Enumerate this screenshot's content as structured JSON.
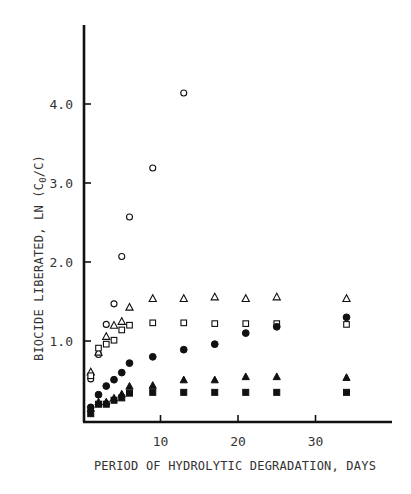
{
  "chart_data": {
    "type": "scatter",
    "title": "",
    "xlabel": "PERIOD OF HYDROLYTIC DEGRADATION, DAYS",
    "ylabel_parts": {
      "pre": "BIOCIDE LIBERATED, LN (C",
      "sub": "0",
      "post": "/C)"
    },
    "ylabel": "BIOCIDE LIBERATED, LN (C0/C)",
    "xlim": [
      0,
      39.5
    ],
    "ylim": [
      0,
      5.0
    ],
    "xticks": [
      10,
      20,
      30
    ],
    "xtick_labels": [
      "10",
      "20",
      "30"
    ],
    "yticks": [
      1.0,
      2.0,
      3.0,
      4.0
    ],
    "ytick_labels": [
      "1.0",
      "2.0",
      "3.0",
      "4.0"
    ],
    "grid": false,
    "legend": "none",
    "series": [
      {
        "name": "open-circle",
        "marker": "circle-open",
        "x": [
          1,
          2,
          3,
          4,
          5,
          6,
          9,
          13
        ],
        "y": [
          0.52,
          0.83,
          1.21,
          1.47,
          2.07,
          2.57,
          3.19,
          4.14
        ]
      },
      {
        "name": "open-triangle",
        "marker": "triangle-open",
        "x": [
          1,
          2,
          3,
          4,
          5,
          6,
          9,
          13,
          17,
          21,
          25,
          34
        ],
        "y": [
          0.61,
          0.86,
          1.06,
          1.2,
          1.25,
          1.43,
          1.54,
          1.54,
          1.56,
          1.54,
          1.56,
          1.54
        ]
      },
      {
        "name": "open-square",
        "marker": "square-open",
        "x": [
          1,
          2,
          3,
          4,
          5,
          6,
          9,
          13,
          17,
          21,
          25,
          34
        ],
        "y": [
          0.56,
          0.91,
          0.96,
          1.01,
          1.14,
          1.2,
          1.23,
          1.23,
          1.22,
          1.22,
          1.22,
          1.21
        ]
      },
      {
        "name": "filled-circle",
        "marker": "circle-filled",
        "x": [
          1,
          2,
          3,
          4,
          5,
          6,
          9,
          13,
          17,
          21,
          25,
          34
        ],
        "y": [
          0.16,
          0.32,
          0.43,
          0.51,
          0.6,
          0.72,
          0.8,
          0.89,
          0.96,
          1.1,
          1.18,
          1.3
        ]
      },
      {
        "name": "filled-triangle",
        "marker": "triangle-filled",
        "x": [
          1,
          2,
          3,
          4,
          5,
          6,
          9,
          13,
          17,
          21,
          25,
          34
        ],
        "y": [
          0.15,
          0.23,
          0.23,
          0.28,
          0.33,
          0.43,
          0.44,
          0.51,
          0.51,
          0.55,
          0.55,
          0.54
        ]
      },
      {
        "name": "filled-square",
        "marker": "square-filled",
        "x": [
          1,
          2,
          3,
          4,
          5,
          6,
          9,
          13,
          17,
          21,
          25,
          34
        ],
        "y": [
          0.08,
          0.2,
          0.2,
          0.25,
          0.28,
          0.34,
          0.35,
          0.35,
          0.35,
          0.35,
          0.35,
          0.35
        ]
      }
    ]
  },
  "style": {
    "ink": "#111111",
    "text": "#333333",
    "background": "#ffffff"
  }
}
